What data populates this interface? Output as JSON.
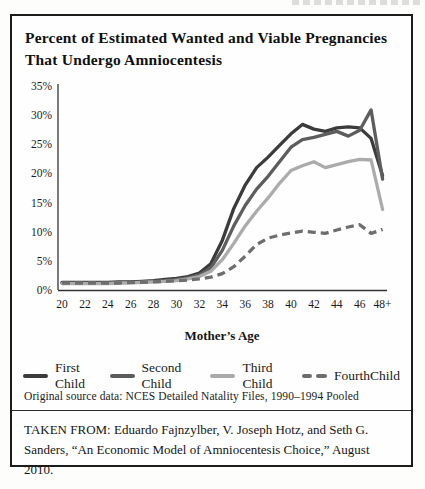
{
  "figure": {
    "title_line1": "Percent of Estimated Wanted and Viable Pregnancies",
    "title_line2": "That Undergo Amniocentesis",
    "source_note": "Original source data: NCES Detailed Natality Files, 1990–1994 Pooled",
    "citation": "TAKEN FROM: Eduardo Fajnzylber, V. Joseph Hotz, and Seth G. Sanders, “An Economic Model of Amniocentesis Choice,” August 2010."
  },
  "chart_data": {
    "type": "line",
    "title": "Percent of Estimated Wanted and Viable Pregnancies That Undergo Amniocentesis",
    "xlabel": "Mother’s Age",
    "ylabel": "",
    "ylim": [
      0,
      35
    ],
    "grid": false,
    "legend_position": "bottom",
    "y_ticks": [
      "0%",
      "5%",
      "10%",
      "15%",
      "20%",
      "25%",
      "30%",
      "35%"
    ],
    "x_tick_labels": [
      "20",
      "22",
      "24",
      "26",
      "28",
      "30",
      "32",
      "34",
      "36",
      "38",
      "40",
      "42",
      "44",
      "46",
      "48+"
    ],
    "x_values": [
      20,
      21,
      22,
      23,
      24,
      25,
      26,
      27,
      28,
      29,
      30,
      31,
      32,
      33,
      34,
      35,
      36,
      37,
      38,
      39,
      40,
      41,
      42,
      43,
      44,
      45,
      46,
      47,
      48
    ],
    "series": [
      {
        "name": "First Child",
        "color": "#3b3b3b",
        "style": "solid",
        "values": [
          1.3,
          1.3,
          1.3,
          1.3,
          1.3,
          1.4,
          1.4,
          1.5,
          1.6,
          1.8,
          2.0,
          2.3,
          2.9,
          4.5,
          8.5,
          14.0,
          18.0,
          21.0,
          22.8,
          24.8,
          26.8,
          28.4,
          27.6,
          27.2,
          27.8,
          28.0,
          27.8,
          26.0,
          19.6
        ]
      },
      {
        "name": "Second Child",
        "color": "#5d5d5d",
        "style": "solid",
        "values": [
          1.2,
          1.2,
          1.2,
          1.2,
          1.2,
          1.3,
          1.3,
          1.4,
          1.5,
          1.6,
          1.8,
          2.1,
          2.6,
          3.8,
          6.8,
          11.0,
          14.5,
          17.3,
          19.5,
          22.0,
          24.5,
          25.8,
          26.2,
          26.7,
          27.2,
          26.4,
          27.4,
          30.9,
          19.0
        ]
      },
      {
        "name": "Third Child",
        "color": "#ababab",
        "style": "solid",
        "values": [
          1.1,
          1.1,
          1.1,
          1.1,
          1.1,
          1.2,
          1.2,
          1.3,
          1.4,
          1.5,
          1.6,
          1.9,
          2.3,
          3.2,
          5.2,
          8.0,
          11.0,
          13.5,
          15.8,
          18.3,
          20.5,
          21.3,
          22.0,
          21.0,
          21.5,
          22.0,
          22.4,
          22.3,
          13.8
        ]
      },
      {
        "name": "FourthChild",
        "color": "#6e6e6e",
        "style": "dashed",
        "values": [
          1.2,
          1.2,
          1.2,
          1.2,
          1.2,
          1.2,
          1.3,
          1.3,
          1.4,
          1.5,
          1.6,
          1.7,
          1.9,
          2.2,
          2.8,
          4.0,
          5.8,
          7.8,
          8.9,
          9.4,
          9.8,
          10.1,
          9.9,
          9.7,
          10.3,
          10.8,
          11.2,
          9.7,
          10.4
        ]
      }
    ]
  }
}
